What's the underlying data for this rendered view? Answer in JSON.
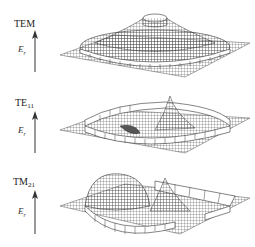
{
  "figure": {
    "panels": [
      {
        "mode": "TEM",
        "mode_base": "TEM",
        "mode_sub": "",
        "axis_symbol": "E",
        "axis_sub": "r"
      },
      {
        "mode": "TE11",
        "mode_base": "TE",
        "mode_sub": "11",
        "axis_symbol": "E",
        "axis_sub": "r"
      },
      {
        "mode": "TM21",
        "mode_base": "TM",
        "mode_sub": "21",
        "axis_symbol": "E",
        "axis_sub": "r"
      }
    ],
    "colors": {
      "mesh": "#333333",
      "band": "#ffffff",
      "text": "#222222"
    }
  }
}
